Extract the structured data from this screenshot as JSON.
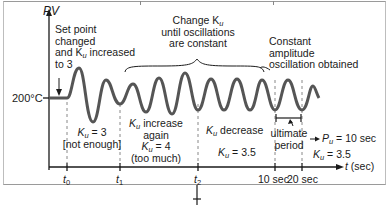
{
  "figure": {
    "y_axis_label": "PV",
    "x_axis_label_var": "t",
    "x_axis_label_unit": "(sec)",
    "setpoint_value": "200°C",
    "annotations": {
      "setpoint_changed": [
        "Set point",
        "changed",
        "and K",
        "u",
        " increased",
        "to 3"
      ],
      "change_ku": [
        "Change K",
        "u",
        "until oscillations",
        "are constant"
      ],
      "constant_amplitude": [
        "Constant",
        "amplitude",
        "oscillation obtained"
      ],
      "ku3": [
        "K",
        "u",
        " = 3",
        "[not enough]"
      ],
      "ku4": [
        "K",
        "u",
        " increase",
        "again",
        "K",
        "u",
        " = 4",
        "(too much)"
      ],
      "ku_decrease": [
        "K",
        "u",
        " decrease"
      ],
      "ku35": [
        "K",
        "u",
        " = 3.5"
      ],
      "ultimate_period": [
        "ultimate",
        "period"
      ],
      "result_pu": [
        "P",
        "u",
        " = 10 sec"
      ],
      "result_ku": [
        "K",
        "u",
        " = 3.5"
      ]
    },
    "x_ticks": [
      {
        "var": "t",
        "sub": "0"
      },
      {
        "var": "t",
        "sub": "1"
      },
      {
        "var": "t",
        "sub": "2"
      },
      {
        "label": "10 sec"
      },
      {
        "label": "20 sec"
      }
    ],
    "colors": {
      "waveform": "#555555",
      "axis": "#1a1a1a",
      "dashed": "#888888",
      "frame": "#9a9a9a"
    }
  }
}
